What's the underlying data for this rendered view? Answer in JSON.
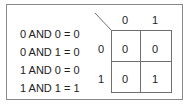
{
  "equations": [
    "0 AND 0 = 0",
    "0 AND 1 = 0",
    "1 AND 0 = 0",
    "1 AND 1 = 1"
  ],
  "kmap": {
    "column_headers": [
      "0",
      "1"
    ],
    "row_headers": [
      "0",
      "1"
    ],
    "cells": [
      [
        "0",
        "0"
      ],
      [
        "0",
        "1"
      ]
    ]
  },
  "colors": {
    "text": "#222222",
    "frame": "#8a8a8a",
    "grid": "#6f6f6f",
    "background": "#ffffff"
  }
}
